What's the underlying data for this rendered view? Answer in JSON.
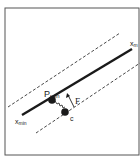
{
  "diagram": {
    "labels": {
      "x_min": {
        "main": "x",
        "sub": "min"
      },
      "x_max": {
        "main": "x",
        "sub": "m"
      },
      "p_min": {
        "main": "P",
        "sub": "min"
      },
      "force": "F",
      "point_c": "c"
    },
    "colors": {
      "line": "#1a1a1a",
      "frame": "#444444",
      "background": "#ffffff"
    }
  }
}
